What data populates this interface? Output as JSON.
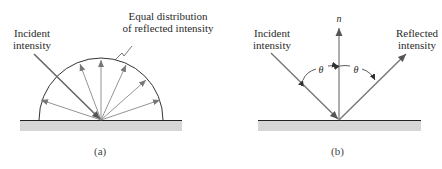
{
  "panels": [
    {
      "id": "a",
      "caption": "(a)",
      "title": "Diffuse reflection",
      "labels": {
        "incident_line1": "Incident",
        "incident_line2": "intensity",
        "distribution_line1": "Equal distribution",
        "distribution_line2": "of reflected intensity"
      }
    },
    {
      "id": "b",
      "caption": "(b)",
      "title": "Specular reflection",
      "labels": {
        "incident_line1": "Incident",
        "incident_line2": "intensity",
        "reflected_line1": "Reflected",
        "reflected_line2": "intensity",
        "normal": "n",
        "angle_left": "θ",
        "angle_right": "θ"
      }
    }
  ],
  "colors": {
    "ray": "#7a7a7a",
    "incident_ray": "#666666",
    "surface_line": "#222222",
    "surface_fill": "#d6d6d6",
    "outline": "#333333"
  }
}
